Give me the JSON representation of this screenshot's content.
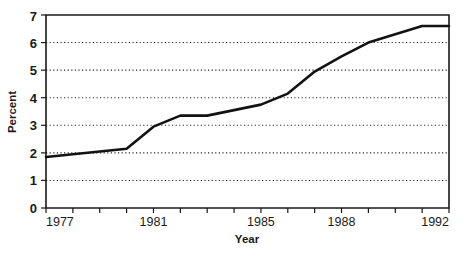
{
  "chart_data": {
    "type": "line",
    "title": "",
    "xlabel": "Year",
    "ylabel": "Percent",
    "xlim": [
      1977,
      1992
    ],
    "ylim": [
      0,
      7
    ],
    "grid": true,
    "legend": "none",
    "x": [
      1977,
      1978,
      1979,
      1980,
      1981,
      1982,
      1983,
      1984,
      1985,
      1986,
      1987,
      1988,
      1989,
      1990,
      1991,
      1992
    ],
    "values": [
      1.85,
      1.95,
      2.05,
      2.15,
      2.95,
      3.35,
      3.35,
      3.55,
      3.75,
      4.15,
      4.95,
      5.5,
      6.0,
      6.3,
      6.6,
      6.6
    ],
    "series": [
      {
        "name": "Percent",
        "values": [
          1.85,
          1.95,
          2.05,
          2.15,
          2.95,
          3.35,
          3.35,
          3.55,
          3.75,
          4.15,
          4.95,
          5.5,
          6.0,
          6.3,
          6.6,
          6.6
        ]
      }
    ],
    "y_ticks": [
      0,
      1,
      2,
      3,
      4,
      5,
      6,
      7
    ],
    "y_tick_labels": [
      "0",
      "1",
      "2",
      "3",
      "4",
      "5",
      "6",
      "7"
    ],
    "x_ticks": [
      1977,
      1978,
      1979,
      1980,
      1981,
      1982,
      1983,
      1984,
      1985,
      1986,
      1987,
      1988,
      1989,
      1990,
      1991,
      1992
    ],
    "x_tick_labels": [
      "1977",
      "",
      "",
      "",
      "1981",
      "",
      "",
      "",
      "1985",
      "",
      "",
      "1988",
      "",
      "",
      "",
      "1992"
    ],
    "line_color": "#121212",
    "grid_color": "#2b2b2b",
    "axis_color": "#1a1a1a"
  },
  "axis": {
    "y_title": "Percent",
    "x_title": "Year"
  },
  "y_labels": {
    "t0": "0",
    "t1": "1",
    "t2": "2",
    "t3": "3",
    "t4": "4",
    "t5": "5",
    "t6": "6",
    "t7": "7"
  },
  "x_labels": {
    "start": "1977",
    "a": "1981",
    "b": "1985",
    "c": "1988",
    "end": "1992"
  }
}
